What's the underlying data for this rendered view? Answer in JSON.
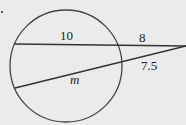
{
  "diagram": {
    "bullet": ".",
    "labels": {
      "upper_inner": "10",
      "upper_outer": "8",
      "lower_outer": "7.5",
      "lower_inner": "m"
    },
    "colors": {
      "line": "#333333",
      "background": "#ebebeb"
    }
  }
}
